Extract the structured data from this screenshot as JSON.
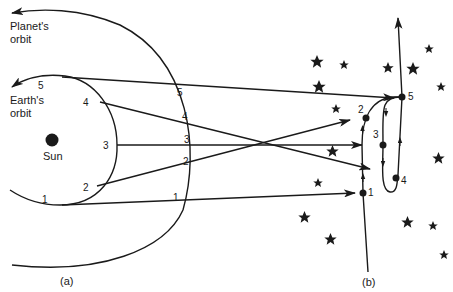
{
  "diagram": {
    "labels": {
      "planet_orbit_line1": "Planet's",
      "planet_orbit_line2": "orbit",
      "earth_orbit_line1": "Earth's",
      "earth_orbit_line2": "orbit",
      "sun": "Sun",
      "panel_a": "(a)",
      "panel_b": "(b)"
    },
    "earth_points": [
      "1",
      "2",
      "3",
      "4",
      "5"
    ],
    "planet_points": [
      "1",
      "2",
      "3",
      "4",
      "5"
    ],
    "apparent_points": [
      "1",
      "2",
      "3",
      "4",
      "5"
    ],
    "colors": {
      "ink": "#1a1a1a",
      "background": "#ffffff"
    }
  }
}
